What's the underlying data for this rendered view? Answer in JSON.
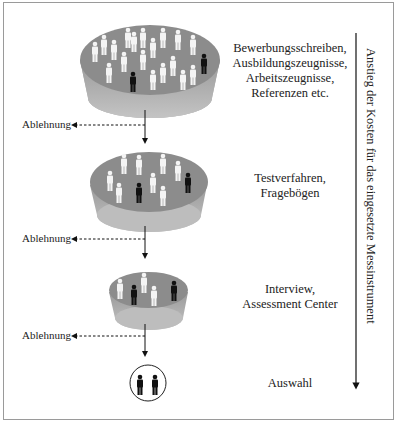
{
  "diagram": {
    "stages": [
      {
        "lines": [
          "Bewerbungsschreiben,",
          "Ausbildungszeugnisse,",
          "Arbeitszeugnisse,",
          "Referenzen etc."
        ],
        "white_figures": 18,
        "black_figures": 2
      },
      {
        "lines": [
          "Testverfahren,",
          "Fragebögen"
        ],
        "white_figures": 8,
        "black_figures": 2
      },
      {
        "lines": [
          "Interview,",
          "Assessment Center"
        ],
        "white_figures": 3,
        "black_figures": 2
      },
      {
        "lines": [
          "Auswahl"
        ],
        "white_figures": 0,
        "black_figures": 2
      }
    ],
    "rejection_labels": [
      "Ablehnung",
      "Ablehnung",
      "Ablehnung"
    ],
    "cost_axis_label": "Anstieg der Kosten für das eingesetzte Messinstrument",
    "colors": {
      "bowl_top": "#8c8c8c",
      "bowl_side": "#b0b0b0",
      "figure_white": "#f4f4f4",
      "figure_black": "#111111",
      "frame": "#9a9a9a"
    }
  }
}
